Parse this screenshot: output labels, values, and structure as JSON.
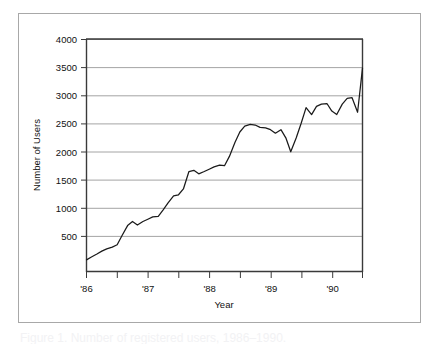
{
  "figure": {
    "caption_partial": "Figure 1.  Number of registered users, 1986–1990.",
    "border_color": "#a8a8a8",
    "background": "#ffffff"
  },
  "chart_data": {
    "type": "line",
    "title": "",
    "xlabel": "Year",
    "ylabel": "Number of Users",
    "line_color": "#1b1b1b",
    "grid": true,
    "legend": null,
    "xlim": [
      1986.0,
      1990.5
    ],
    "ylim": [
      0,
      4000
    ],
    "y_ticks": [
      500,
      1000,
      1500,
      2000,
      2500,
      3000,
      3500,
      4000
    ],
    "y_tick_labels": [
      "500",
      "1000",
      "1500",
      "2000",
      "2500",
      "3000",
      "3500",
      "4000"
    ],
    "x_ticks": [
      1986,
      1987,
      1988,
      1989,
      1990
    ],
    "x_tick_labels": [
      "'86",
      "'87",
      "'88",
      "'89",
      "'90"
    ],
    "x_minor_ticks": [
      1986.5,
      1987.5,
      1988.5,
      1989.5,
      1990.5
    ],
    "series": [
      {
        "name": "Number of Users",
        "x": [
          1986.0,
          1986.08,
          1986.17,
          1986.25,
          1986.33,
          1986.42,
          1986.5,
          1986.58,
          1986.67,
          1986.75,
          1986.83,
          1986.92,
          1987.0,
          1987.08,
          1987.17,
          1987.25,
          1987.33,
          1987.42,
          1987.5,
          1987.58,
          1987.67,
          1987.75,
          1987.83,
          1987.92,
          1988.0,
          1988.08,
          1988.17,
          1988.25,
          1988.33,
          1988.42,
          1988.5,
          1988.58,
          1988.67,
          1988.75,
          1988.83,
          1988.92,
          1989.0,
          1989.08,
          1989.17,
          1989.25,
          1989.33,
          1989.42,
          1989.5,
          1989.58,
          1989.67,
          1989.75,
          1989.83,
          1989.92,
          1990.0,
          1990.08,
          1990.17,
          1990.25,
          1990.33,
          1990.42
        ],
        "values": [
          200,
          250,
          300,
          350,
          390,
          420,
          460,
          620,
          790,
          860,
          800,
          860,
          900,
          940,
          950,
          1060,
          1180,
          1300,
          1320,
          1420,
          1720,
          1740,
          1680,
          1720,
          1760,
          1800,
          1830,
          1820,
          1980,
          2220,
          2400,
          2500,
          2530,
          2520,
          2480,
          2470,
          2440,
          2380,
          2440,
          2300,
          2060,
          2300,
          2550,
          2820,
          2700,
          2840,
          2880,
          2890,
          2760,
          2700,
          2880,
          2980,
          2990,
          2740
        ]
      }
    ],
    "series_tail": {
      "x": [
        1990.42,
        1990.5
      ],
      "values": [
        2740,
        3500
      ]
    },
    "notable_points": {
      "start_value": 200,
      "start_year": "'86",
      "end_value": 3500,
      "end_year": "mid '90",
      "max_value": 3550,
      "min_value": 200,
      "local_dip_1989": 2060
    }
  }
}
